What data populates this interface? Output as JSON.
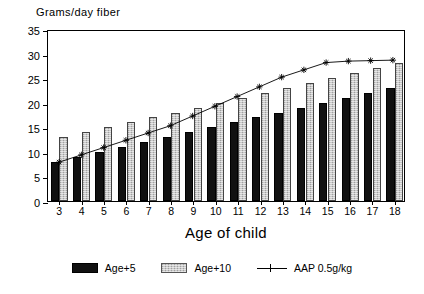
{
  "chart_data": {
    "type": "bar",
    "title": "",
    "ylabel": "Grams/day fiber",
    "xlabel": "Age of child",
    "categories": [
      "3",
      "4",
      "5",
      "6",
      "7",
      "8",
      "9",
      "10",
      "11",
      "12",
      "13",
      "14",
      "15",
      "16",
      "17",
      "18"
    ],
    "ylim": [
      0,
      35
    ],
    "yticks": [
      0,
      5,
      10,
      15,
      20,
      25,
      30,
      35
    ],
    "grid": false,
    "legend_position": "bottom",
    "series": [
      {
        "name": "Age+5",
        "type": "bar",
        "style": "solid-black",
        "values": [
          8,
          9,
          10,
          11,
          12,
          13,
          14,
          15,
          16,
          17,
          18,
          19,
          20,
          21,
          22,
          23
        ]
      },
      {
        "name": "Age+10",
        "type": "bar",
        "style": "hatched-gray",
        "values": [
          13,
          14,
          15,
          16,
          17,
          18,
          19,
          20,
          21,
          22,
          23,
          24,
          25,
          26,
          27,
          28
        ]
      },
      {
        "name": "AAP 0.5g/kg",
        "type": "line",
        "style": "line-star-marker",
        "values": [
          8,
          9.5,
          11,
          12.5,
          14,
          15.5,
          17.5,
          19.5,
          21.5,
          23.5,
          25.5,
          27,
          28.5,
          28.8,
          28.9,
          29
        ]
      }
    ]
  },
  "legend": {
    "items": [
      {
        "label": "Age+5",
        "marker": "black-square-icon"
      },
      {
        "label": "Age+10",
        "marker": "hatched-square-icon"
      },
      {
        "label": "AAP 0.5g/kg",
        "marker": "line-star-icon"
      }
    ]
  }
}
